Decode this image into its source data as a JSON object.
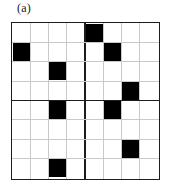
{
  "panel": {
    "label": "(a)",
    "caption_text": "(a)"
  },
  "colors": {
    "background": "#ffffff",
    "minor_gridline": "#c9c9c9",
    "major_gridline": "#1c1c1c",
    "border": "#1c1c1c",
    "filled_cell": "#000000",
    "label_text": "#1a1a1a"
  },
  "chart_data": {
    "type": "heatmap",
    "title": "(a)",
    "xlabel": "",
    "ylabel": "",
    "grid": true,
    "legend_position": "none",
    "rows": 8,
    "cols": 8,
    "block_rows": 2,
    "block_cols": 2,
    "block_size": 4,
    "value_labels": {
      "0": "empty",
      "1": "filled"
    },
    "filled_cells": [
      [
        0,
        4
      ],
      [
        1,
        0
      ],
      [
        1,
        5
      ],
      [
        2,
        2
      ],
      [
        3,
        6
      ],
      [
        4,
        2
      ],
      [
        4,
        5
      ],
      [
        6,
        6
      ],
      [
        7,
        2
      ]
    ],
    "filled_count": 9,
    "matrix": [
      [
        0,
        0,
        0,
        0,
        1,
        0,
        0,
        0
      ],
      [
        1,
        0,
        0,
        0,
        0,
        1,
        0,
        0
      ],
      [
        0,
        0,
        1,
        0,
        0,
        0,
        0,
        0
      ],
      [
        0,
        0,
        0,
        0,
        0,
        0,
        1,
        0
      ],
      [
        0,
        0,
        1,
        0,
        0,
        0,
        0,
        0
      ],
      [
        0,
        0,
        0,
        0,
        0,
        0,
        0,
        0
      ],
      [
        0,
        0,
        0,
        0,
        0,
        0,
        1,
        0
      ],
      [
        0,
        0,
        1,
        0,
        0,
        0,
        0,
        0
      ]
    ],
    "quadrants": [
      {
        "name": "top-left",
        "filled_cells": [
          [
            1,
            0
          ],
          [
            2,
            2
          ]
        ]
      },
      {
        "name": "top-right",
        "filled_cells": [
          [
            0,
            0
          ],
          [
            1,
            1
          ],
          [
            3,
            2
          ]
        ]
      },
      {
        "name": "bottom-left",
        "filled_cells": [
          [
            0,
            2
          ],
          [
            3,
            2
          ]
        ]
      },
      {
        "name": "bottom-right",
        "filled_cells": [
          [
            0,
            1
          ],
          [
            2,
            2
          ]
        ]
      }
    ]
  }
}
